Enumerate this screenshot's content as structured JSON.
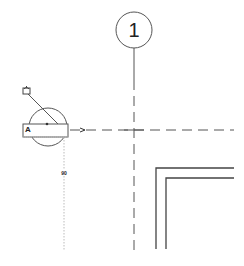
{
  "drawing": {
    "view": "floor-plan",
    "grid": {
      "label": "1",
      "bubble_center": [
        134,
        30
      ],
      "bubble_radius": 18,
      "line_x": 134,
      "line_style": "dashed"
    },
    "horizontal_grid_line": {
      "y": 130,
      "style": "dashed",
      "x_start": 70,
      "x_end": 244
    },
    "elevation_marker": {
      "label": "A",
      "center": [
        48,
        127
      ],
      "radius": 20,
      "dimension_text": "90"
    },
    "wall_corner": {
      "outer_x": 156,
      "outer_y": 168,
      "inner_x": 166,
      "inner_y": 178
    },
    "colors": {
      "line": "#444444",
      "background": "#ffffff",
      "dotted_extension": "#bbbbbb"
    }
  }
}
